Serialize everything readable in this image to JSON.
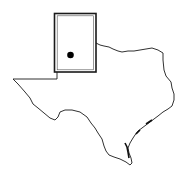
{
  "map": {
    "region": "Texas",
    "highlight": "Panhandle region",
    "marker": "location-dot",
    "colors": {
      "outline": "#1a1a1a",
      "background": "#ffffff",
      "marker": "#000000"
    }
  }
}
